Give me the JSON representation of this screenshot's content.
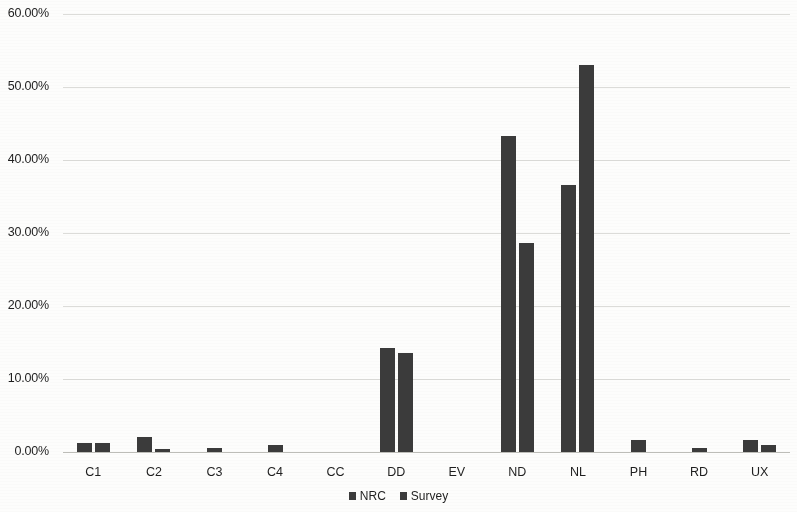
{
  "chart_data": {
    "type": "bar",
    "title": "",
    "xlabel": "",
    "ylabel": "",
    "categories": [
      "C1",
      "C2",
      "C3",
      "C4",
      "CC",
      "DD",
      "EV",
      "ND",
      "NL",
      "PH",
      "RD",
      "UX"
    ],
    "series": [
      {
        "name": "NRC",
        "values": [
          1.2,
          2.1,
          0.5,
          0.0,
          0.0,
          14.2,
          0.0,
          43.3,
          36.6,
          1.7,
          0.5,
          1.7
        ]
      },
      {
        "name": "Survey",
        "values": [
          1.3,
          0.4,
          0.0,
          0.9,
          0.0,
          13.5,
          0.0,
          28.6,
          53.0,
          0.0,
          0.0,
          1.0
        ]
      }
    ],
    "ylim": [
      0,
      60
    ],
    "ytick_values": [
      0,
      10,
      20,
      30,
      40,
      50,
      60
    ],
    "ytick_labels": [
      "0.00%",
      "10.00%",
      "20.00%",
      "30.00%",
      "40.00%",
      "50.00%",
      "60.00%"
    ],
    "value_unit": "percent",
    "grid": true,
    "grid_axis": "y",
    "legend_position": "bottom",
    "bar_color": "#3b3b3b",
    "gridline_color": "#d6d6d2"
  },
  "legend": {
    "items": [
      {
        "label": "NRC"
      },
      {
        "label": "Survey"
      }
    ]
  }
}
